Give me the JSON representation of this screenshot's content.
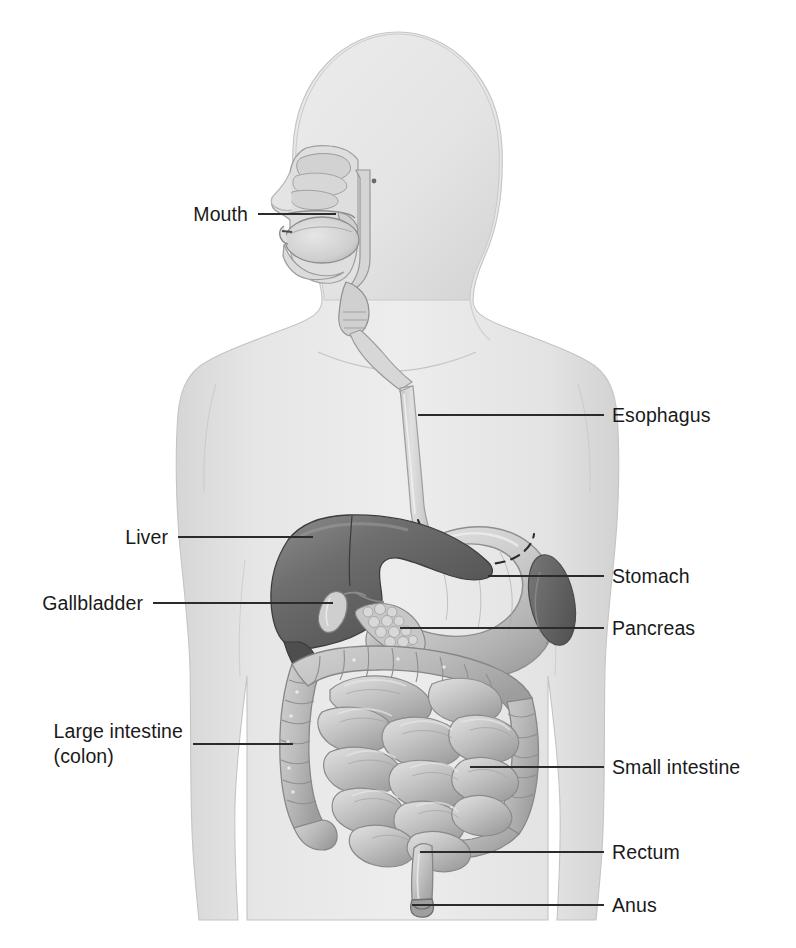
{
  "figure": {
    "background_color": "#ffffff",
    "label_color": "#1a1a1a",
    "leader_line_color": "#2b2b2b",
    "body_silhouette_color": "#e2e2e2",
    "organ_mid_color": "#bdbdbd",
    "organ_dark_color": "#6f6f6f",
    "liver_color": "#5f5f5f"
  },
  "labels": {
    "mouth": {
      "text": "Mouth",
      "side": "left",
      "x": 248,
      "y": 214,
      "leader_from_x": 258,
      "leader_to_x": 336,
      "leader_y": 214
    },
    "esophagus": {
      "text": "Esophagus",
      "side": "right",
      "x": 612,
      "y": 415,
      "leader_from_x": 418,
      "leader_to_x": 604,
      "leader_y": 415
    },
    "liver": {
      "text": "Liver",
      "side": "left",
      "x": 168,
      "y": 537,
      "leader_from_x": 178,
      "leader_to_x": 313,
      "leader_y": 537
    },
    "stomach": {
      "text": "Stomach",
      "side": "right",
      "x": 612,
      "y": 576,
      "leader_from_x": 488,
      "leader_to_x": 604,
      "leader_y": 576
    },
    "gallbladder": {
      "text": "Gallbladder",
      "side": "left",
      "x": 143,
      "y": 603,
      "leader_from_x": 153,
      "leader_to_x": 333,
      "leader_y": 603
    },
    "pancreas": {
      "text": "Pancreas",
      "side": "right",
      "x": 612,
      "y": 628,
      "leader_from_x": 400,
      "leader_to_x": 604,
      "leader_y": 628
    },
    "large_intestine": {
      "text": "Large intestine\n(colon)",
      "line1": "Large intestine",
      "line2": "(colon)",
      "side": "left",
      "x": 183,
      "y": 744,
      "leader_from_x": 193,
      "leader_to_x": 293,
      "leader_y": 744
    },
    "small_intestine": {
      "text": "Small intestine",
      "side": "right",
      "x": 612,
      "y": 767,
      "leader_from_x": 470,
      "leader_to_x": 604,
      "leader_y": 767
    },
    "rectum": {
      "text": "Rectum",
      "side": "right",
      "x": 612,
      "y": 852,
      "leader_from_x": 420,
      "leader_to_x": 604,
      "leader_y": 852
    },
    "anus": {
      "text": "Anus",
      "side": "right",
      "x": 612,
      "y": 905,
      "leader_from_x": 412,
      "leader_to_x": 604,
      "leader_y": 905
    }
  },
  "organs": [
    "mouth",
    "esophagus",
    "liver",
    "stomach",
    "gallbladder",
    "pancreas",
    "large_intestine",
    "small_intestine",
    "rectum",
    "anus"
  ]
}
